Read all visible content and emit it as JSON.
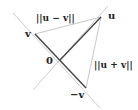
{
  "diagram": {
    "points": {
      "origin": {
        "label": "0",
        "x": 60,
        "y": 60
      },
      "u": {
        "label": "u",
        "x": 101,
        "y": 17
      },
      "v": {
        "label": "v",
        "x": 35,
        "y": 34
      },
      "neg_v": {
        "label": "−v",
        "x": 86,
        "y": 88
      }
    },
    "labels": {
      "u_minus_v": "||u − v||",
      "u_plus_v": "||u + v||"
    },
    "colors": {
      "vector": "#444444",
      "guide": "#cccccc",
      "text": "#222222"
    }
  }
}
